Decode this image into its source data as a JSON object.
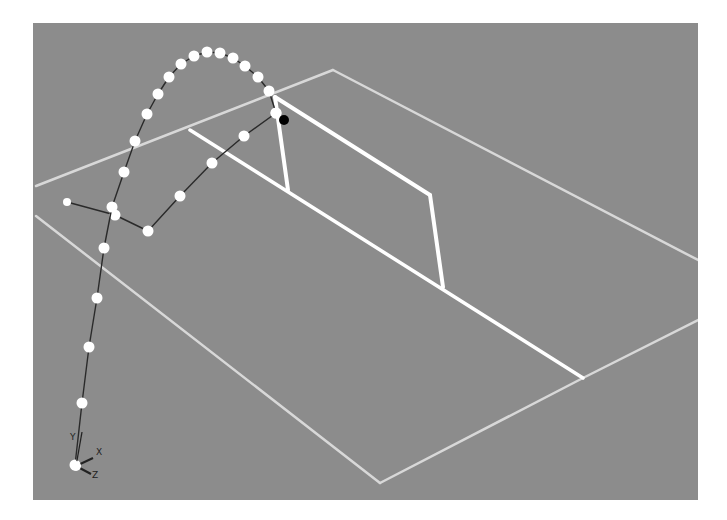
{
  "viewport": {
    "background": "#8c8c8c",
    "description": "3D tennis court viewport with ball trajectory"
  },
  "colors": {
    "court_line": "#ffffff",
    "court_line_faint": "#d8d8d8",
    "trajectory_dot": "#ffffff",
    "trajectory_line": "#2a2a2a",
    "bounce_marker": "#000000"
  },
  "axis_gizmo": {
    "labels": {
      "y": "Y",
      "x": "X",
      "z": "Z"
    }
  },
  "court": {
    "outer_lines": [
      [
        [
          36,
          186
        ],
        [
          333,
          70
        ]
      ],
      [
        [
          333,
          70
        ],
        [
          698,
          260
        ]
      ],
      [
        [
          36,
          216
        ],
        [
          380,
          483
        ]
      ],
      [
        [
          380,
          483
        ],
        [
          583,
          378
        ]
      ],
      [
        [
          583,
          378
        ],
        [
          698,
          320
        ]
      ]
    ],
    "inner_lines": [
      [
        [
          190,
          130
        ],
        [
          583,
          378
        ]
      ]
    ],
    "net": {
      "top": [
        [
          275,
          97
        ],
        [
          430,
          195
        ]
      ],
      "bottom": [
        [
          288,
          190
        ],
        [
          443,
          287
        ]
      ],
      "left_post": [
        [
          275,
          97
        ],
        [
          288,
          190
        ]
      ],
      "right_post": [
        [
          430,
          195
        ],
        [
          443,
          287
        ]
      ]
    }
  },
  "trajectory": {
    "arc_points": [
      [
        75,
        465
      ],
      [
        82,
        403
      ],
      [
        89,
        347
      ],
      [
        97,
        298
      ],
      [
        104,
        248
      ],
      [
        112,
        207
      ],
      [
        124,
        172
      ],
      [
        135,
        141
      ],
      [
        147,
        114
      ],
      [
        158,
        94
      ],
      [
        169,
        77
      ],
      [
        181,
        64
      ],
      [
        194,
        56
      ],
      [
        207,
        52
      ],
      [
        220,
        53
      ],
      [
        233,
        58
      ],
      [
        245,
        66
      ],
      [
        258,
        77
      ],
      [
        269,
        91
      ],
      [
        276,
        113
      ]
    ],
    "ground_path": [
      [
        67,
        202
      ],
      [
        115,
        215
      ],
      [
        148,
        231
      ],
      [
        180,
        196
      ],
      [
        212,
        163
      ],
      [
        244,
        136
      ],
      [
        276,
        113
      ]
    ],
    "bounce_marker": [
      284,
      120
    ]
  }
}
